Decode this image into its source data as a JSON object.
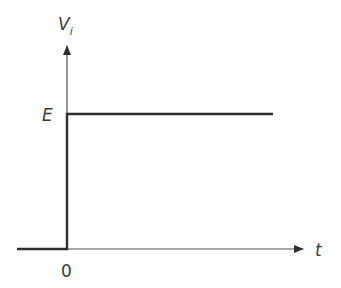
{
  "diagram": {
    "type": "step-function",
    "y_axis": {
      "label": "V",
      "subscript": "i"
    },
    "x_axis": {
      "label": "t"
    },
    "level_label": "E",
    "origin_label": "0",
    "colors": {
      "signal": "#2e2e2e",
      "axis": "#555555",
      "text": "#3a3a3a"
    }
  }
}
